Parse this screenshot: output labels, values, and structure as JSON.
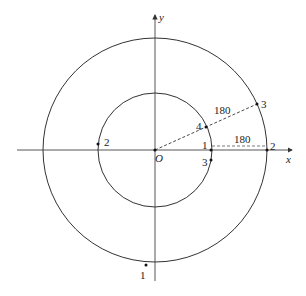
{
  "diagram": {
    "origin_label": "O",
    "x_axis_label": "x",
    "y_axis_label": "y",
    "stroke_color": "#333333",
    "inner_circle": {
      "radius_px": 57
    },
    "outer_circle": {
      "radius_px": 112
    },
    "dimension_labels": {
      "diagonal_gap": "180",
      "horizontal_gap": "180"
    },
    "points": [
      {
        "label": "1",
        "circle": "inner",
        "position": "on x-axis, right"
      },
      {
        "label": "2",
        "circle": "inner",
        "position": "left, slightly above x-axis"
      },
      {
        "label": "3",
        "circle": "inner",
        "position": "right, slightly below x-axis"
      },
      {
        "label": "4",
        "circle": "inner",
        "position": "upper right on dashed ray"
      },
      {
        "label": "1",
        "circle": "outer",
        "position": "bottom, left of y-axis"
      },
      {
        "label": "2",
        "circle": "outer",
        "position": "on x-axis, right"
      },
      {
        "label": "3",
        "circle": "outer",
        "position": "upper right on dashed ray"
      }
    ]
  }
}
